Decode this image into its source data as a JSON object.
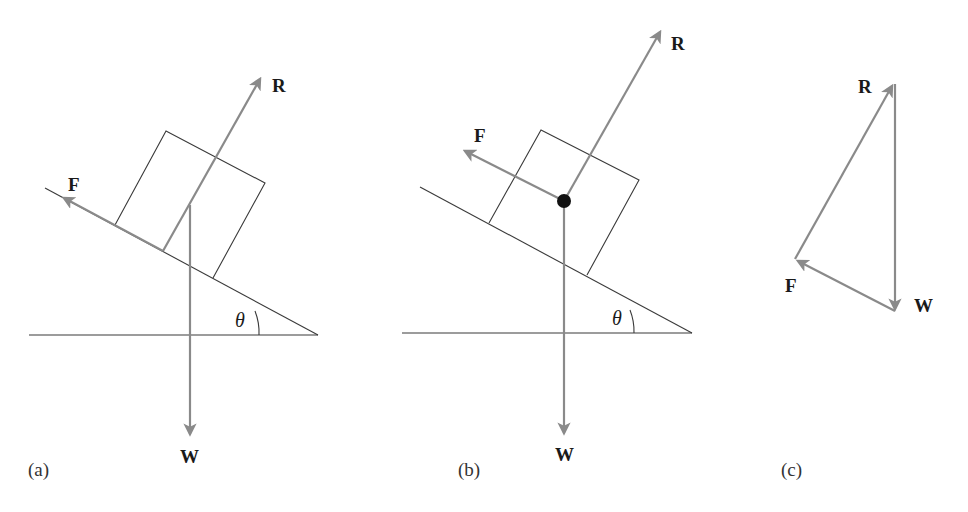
{
  "figure": {
    "colors": {
      "vector": "#8a8a8a",
      "line": "#3a3a3a",
      "text": "#1a1a1a",
      "background": "#ffffff"
    },
    "panels": [
      {
        "id": "a",
        "label": "(a)",
        "angle_label": "θ",
        "forces": {
          "friction": "F",
          "reaction": "R",
          "weight": "W"
        },
        "note": "Forces drawn at their points of application on the block"
      },
      {
        "id": "b",
        "label": "(b)",
        "angle_label": "θ",
        "forces": {
          "friction": "F",
          "reaction": "R",
          "weight": "W"
        },
        "note": "All forces drawn acting through the centre of mass (black dot)"
      },
      {
        "id": "c",
        "label": "(c)",
        "forces": {
          "reaction": "R",
          "friction": "F",
          "weight": "W"
        },
        "note": "Triangle of forces: W, F, R placed head-to-tail forming a closed triangle"
      }
    ]
  }
}
